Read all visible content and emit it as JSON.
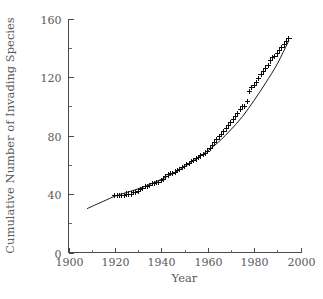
{
  "figure": {
    "width": 323,
    "height": 299,
    "background": "#ffffff",
    "foreground": "#4a4a4a",
    "data_color": "#0d0d0d"
  },
  "labels": {
    "ylabel": "Cumulative Number of Invading Species",
    "xlabel": "Year"
  },
  "chart_data": {
    "type": "scatter",
    "title": "",
    "subtitle": "",
    "xlabel": "Year",
    "ylabel": "Cumulative Number of Invading Species",
    "xlim": [
      1900,
      2000
    ],
    "ylim": [
      0,
      160
    ],
    "xticks": [
      1900,
      1920,
      1940,
      1960,
      1980,
      2000
    ],
    "xticklabels": [
      "1900",
      "1920",
      "1940",
      "1960",
      "1980",
      "2000"
    ],
    "xminorticks": [
      1910,
      1930,
      1950,
      1970,
      1990
    ],
    "yticks": [
      0,
      40,
      80,
      120,
      160
    ],
    "yticklabels": [
      "0",
      "40",
      "80",
      "120",
      "160"
    ],
    "yminorticks": [
      20,
      60,
      100,
      140
    ],
    "grid": false,
    "legend": null,
    "marker": "plus",
    "tick_direction": "in",
    "spines": [
      "left",
      "bottom"
    ],
    "series": [
      {
        "name": "Cumulative invading species",
        "type": "scatter",
        "marker": "plus",
        "color": "#0d0d0d",
        "x": [
          1920,
          1921,
          1922,
          1923,
          1924,
          1925,
          1926,
          1927,
          1928,
          1929,
          1930,
          1931,
          1932,
          1933,
          1934,
          1935,
          1936,
          1937,
          1938,
          1939,
          1940,
          1941,
          1942,
          1943,
          1944,
          1945,
          1946,
          1947,
          1948,
          1949,
          1950,
          1951,
          1952,
          1953,
          1954,
          1955,
          1956,
          1957,
          1958,
          1959,
          1960,
          1961,
          1962,
          1963,
          1964,
          1965,
          1966,
          1967,
          1968,
          1969,
          1970,
          1971,
          1972,
          1973,
          1974,
          1975,
          1976,
          1977,
          1978,
          1979,
          1980,
          1981,
          1982,
          1983,
          1984,
          1985,
          1986,
          1987,
          1988,
          1989,
          1990,
          1991,
          1992,
          1993,
          1994,
          1995
        ],
        "y": [
          39,
          39,
          39,
          39,
          39,
          40,
          40,
          40,
          41,
          41,
          42,
          43,
          44,
          45,
          45,
          46,
          47,
          47,
          48,
          48,
          49,
          50,
          52,
          53,
          54,
          54,
          55,
          56,
          57,
          58,
          59,
          60,
          61,
          62,
          63,
          64,
          65,
          66,
          67,
          68,
          69,
          71,
          73,
          75,
          77,
          79,
          81,
          83,
          85,
          87,
          89,
          91,
          93,
          95,
          98,
          100,
          100,
          103,
          110,
          113,
          114,
          116,
          119,
          122,
          124,
          126,
          128,
          131,
          133,
          134,
          136,
          138,
          140,
          142,
          144,
          146
        ]
      },
      {
        "name": "Fitted curve",
        "type": "line",
        "color": "#1a1a1a",
        "x": [
          1908,
          1915,
          1920,
          1925,
          1930,
          1935,
          1940,
          1945,
          1950,
          1955,
          1960,
          1965,
          1970,
          1975,
          1980,
          1985,
          1990,
          1995
        ],
        "y": [
          30,
          35,
          38.5,
          41,
          43.5,
          46.5,
          50,
          54,
          58.5,
          64,
          69.5,
          76,
          84,
          93,
          104,
          116,
          129,
          145
        ]
      }
    ]
  }
}
